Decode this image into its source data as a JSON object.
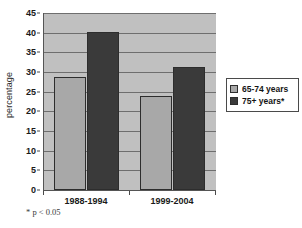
{
  "chart_data": {
    "type": "bar",
    "title": "",
    "xlabel": "",
    "ylabel": "percentage",
    "categories": [
      "1988-1994",
      "1999-2004"
    ],
    "series": [
      {
        "name": "65-74 years",
        "values": [
          28.7,
          24.0
        ],
        "color": "#a8a8a8"
      },
      {
        "name": "75+ years*",
        "values": [
          40.3,
          31.4
        ],
        "color": "#3a3a3a"
      }
    ],
    "ylim": [
      0,
      45
    ],
    "yticks": [
      0,
      5,
      10,
      15,
      20,
      25,
      30,
      35,
      40,
      45
    ],
    "ytick_labels": [
      "0",
      "5",
      "10",
      "15",
      "20",
      "25",
      "30",
      "35",
      "40",
      "45"
    ],
    "grid": true,
    "legend_position": "right",
    "annotations": [
      "* p < 0.05"
    ],
    "plot_background": "#c0c0c0"
  },
  "axis": {
    "y_title": "percentage"
  },
  "legend": {
    "entries": [
      {
        "label": "65-74 years"
      },
      {
        "label": "75+ years*"
      }
    ]
  },
  "footnote": {
    "text": "* p < 0.05"
  }
}
